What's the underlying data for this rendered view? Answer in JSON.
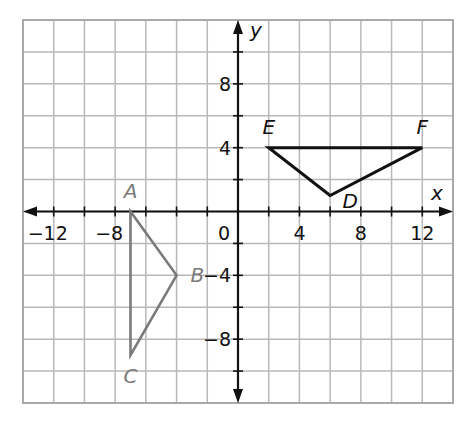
{
  "chart_data": {
    "type": "scatter",
    "title": "",
    "xlabel": "x",
    "ylabel": "y",
    "xlim": [
      -14,
      14
    ],
    "ylim": [
      -12,
      12
    ],
    "grid": true,
    "grid_step": 2,
    "x_ticks": [
      -12,
      -8,
      0,
      4,
      8,
      12
    ],
    "y_ticks": [
      8,
      4,
      -4,
      -8
    ],
    "x_tick_labels": [
      "−12",
      "−8",
      "0",
      "4",
      "8",
      "12"
    ],
    "y_tick_labels": [
      "8",
      "4",
      "−4",
      "−8"
    ],
    "series": [
      {
        "name": "Triangle ABC",
        "color": "#7a7a7a",
        "closed": true,
        "points": [
          {
            "label": "A",
            "x": -7,
            "y": 0
          },
          {
            "label": "B",
            "x": -4,
            "y": -4
          },
          {
            "label": "C",
            "x": -7,
            "y": -9
          }
        ]
      },
      {
        "name": "Triangle DEF",
        "color": "#111111",
        "closed": true,
        "points": [
          {
            "label": "D",
            "x": 6,
            "y": 1
          },
          {
            "label": "E",
            "x": 2,
            "y": 4
          },
          {
            "label": "F",
            "x": 12,
            "y": 4
          }
        ]
      }
    ]
  },
  "labels": {
    "x_axis": "x",
    "y_axis": "y",
    "origin": "0"
  }
}
